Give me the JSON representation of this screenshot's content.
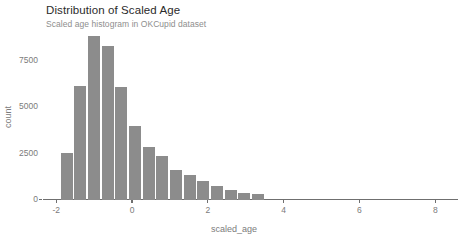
{
  "chart_data": {
    "type": "bar",
    "title": "Distribution of Scaled Age",
    "subtitle": "Scaled age histogram in OKCupid dataset",
    "xlabel": "scaled_age",
    "ylabel": "count",
    "xlim": [
      -2.35,
      8.6
    ],
    "ylim": [
      0,
      9250
    ],
    "grid": false,
    "legend": null,
    "bar_color": "#8c8c8c",
    "bin_width": 0.36,
    "xticks": [
      -2,
      0,
      2,
      4,
      6,
      8
    ],
    "xtick_labels": [
      "-2",
      "0",
      "2",
      "4",
      "6",
      "8"
    ],
    "yticks": [
      0,
      2500,
      5000,
      7500
    ],
    "ytick_labels": [
      "0",
      "2500",
      "5000",
      "7500"
    ],
    "x": [
      -1.7,
      -1.34,
      -0.98,
      -0.62,
      -0.26,
      0.1,
      0.46,
      0.82,
      1.18,
      1.54,
      1.9,
      2.26,
      2.62,
      2.98,
      3.34
    ],
    "values": [
      2550,
      6150,
      8800,
      8300,
      6100,
      4000,
      2850,
      2350,
      1600,
      1350,
      1000,
      780,
      560,
      400,
      330
    ],
    "bars": [
      {
        "x": -1.7,
        "count": 2550
      },
      {
        "x": -1.34,
        "count": 6150
      },
      {
        "x": -0.98,
        "count": 8800
      },
      {
        "x": -0.62,
        "count": 8300
      },
      {
        "x": -0.26,
        "count": 6100
      },
      {
        "x": 0.1,
        "count": 4000
      },
      {
        "x": 0.46,
        "count": 2850
      },
      {
        "x": 0.82,
        "count": 2350
      },
      {
        "x": 1.18,
        "count": 1600
      },
      {
        "x": 1.54,
        "count": 1350
      },
      {
        "x": 1.9,
        "count": 1000
      },
      {
        "x": 2.26,
        "count": 780
      },
      {
        "x": 2.62,
        "count": 560
      },
      {
        "x": 2.98,
        "count": 400
      },
      {
        "x": 3.34,
        "count": 330
      }
    ]
  }
}
